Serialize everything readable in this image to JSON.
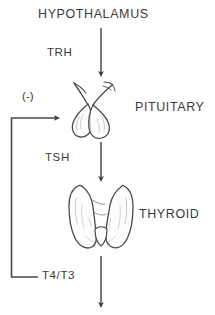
{
  "diagram": {
    "background_color": "#ffffff",
    "ink_color": "#3a3a3a",
    "line_color": "#4a4a4a",
    "organs": [
      {
        "id": "hypothalamus",
        "label": "HYPOTHALAMUS",
        "illustration": "none"
      },
      {
        "id": "pituitary",
        "label": "PITUITARY",
        "illustration": "pituitary-gland-icon"
      },
      {
        "id": "thyroid",
        "label": "THYROID",
        "illustration": "thyroid-gland-icon"
      }
    ],
    "hormones": [
      {
        "id": "trh",
        "label": "TRH",
        "from": "hypothalamus",
        "to": "pituitary",
        "effect": "stimulatory"
      },
      {
        "id": "tsh",
        "label": "TSH",
        "from": "pituitary",
        "to": "thyroid",
        "effect": "stimulatory"
      },
      {
        "id": "t4t3",
        "label": "T4/T3",
        "from": "thyroid",
        "to": "periphery",
        "effect": "stimulatory"
      }
    ],
    "feedback": {
      "label": "(-)",
      "from": "t4t3",
      "to": "pituitary",
      "effect": "negative"
    }
  }
}
